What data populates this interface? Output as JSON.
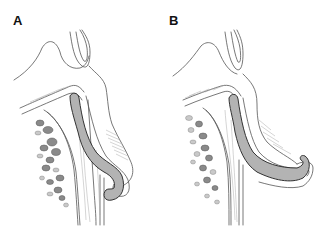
{
  "figure": {
    "panels": [
      {
        "id": "A",
        "label": "A",
        "description": "Sagittal section showing gray-shaded curved tube ending in a deep S-shaped hook"
      },
      {
        "id": "B",
        "label": "B",
        "description": "Sagittal section showing gray-shaded tube extended forward ending in a shallow hook"
      }
    ],
    "colors": {
      "line": "#555555",
      "outline_dark": "#222222",
      "tube_fill": "#b3b3b3",
      "background": "#ffffff"
    }
  }
}
